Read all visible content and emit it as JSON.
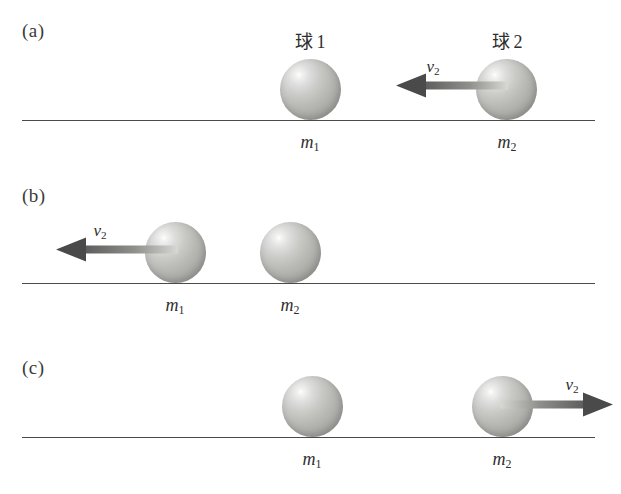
{
  "figure": {
    "type": "physics-diagram",
    "colors": {
      "baseline": "#4a4a4a",
      "arrow_head": "#4a4a4a",
      "arrow_shaft_dark": "#5a5a5a",
      "arrow_shaft_light": "#cfcfcc",
      "ball_highlight": "#ffffff",
      "ball_mid": "#c9c9c6",
      "ball_edge": "#9a9a96",
      "text": "#2e2e2e"
    },
    "panels": [
      {
        "label": "(a)",
        "ball1": {
          "caption_word": "球",
          "caption_number": "1",
          "mass_symbol": "m",
          "mass_subscript": "1"
        },
        "ball2": {
          "caption_word": "球",
          "caption_number": "2",
          "mass_symbol": "m",
          "mass_subscript": "2"
        },
        "velocity": {
          "symbol": "v",
          "subscript": "2",
          "direction": "left",
          "attached_to": "ball2"
        }
      },
      {
        "label": "(b)",
        "ball1": {
          "caption_word": "",
          "caption_number": "",
          "mass_symbol": "m",
          "mass_subscript": "1"
        },
        "ball2": {
          "caption_word": "",
          "caption_number": "",
          "mass_symbol": "m",
          "mass_subscript": "2"
        },
        "velocity": {
          "symbol": "v",
          "subscript": "2",
          "direction": "left",
          "attached_to": "ball1"
        }
      },
      {
        "label": "(c)",
        "ball1": {
          "caption_word": "",
          "caption_number": "",
          "mass_symbol": "m",
          "mass_subscript": "1"
        },
        "ball2": {
          "caption_word": "",
          "caption_number": "",
          "mass_symbol": "m",
          "mass_subscript": "2"
        },
        "velocity": {
          "symbol": "v",
          "subscript": "2",
          "direction": "right",
          "attached_to": "ball2"
        }
      }
    ]
  }
}
